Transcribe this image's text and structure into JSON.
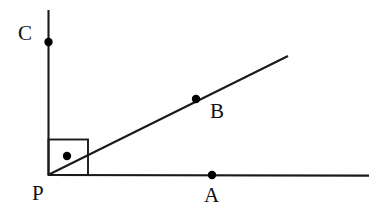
{
  "figure": {
    "kind": "geometry-diagram",
    "background_color": "#ffffff",
    "stroke_color": "#1a1a1a",
    "point_color": "#000000",
    "canvas": {
      "width": 383,
      "height": 217
    },
    "labels": {
      "point_a": "A",
      "point_b": "B",
      "point_c": "C",
      "point_p": "P"
    },
    "label_positions": {
      "point_a": {
        "x": 204,
        "y": 185
      },
      "point_b": {
        "x": 210,
        "y": 101
      },
      "point_c": {
        "x": 18,
        "y": 23
      },
      "point_p": {
        "x": 32,
        "y": 183
      }
    },
    "points": [
      {
        "name": "P",
        "x": 48,
        "y": 175,
        "marked": false,
        "radius": 0
      },
      {
        "name": "C",
        "x": 48,
        "y": 42,
        "marked": true,
        "radius": 4.2
      },
      {
        "name": "B",
        "x": 196,
        "y": 99,
        "marked": true,
        "radius": 4.2
      },
      {
        "name": "A",
        "x": 212,
        "y": 175,
        "marked": true,
        "radius": 4.2
      },
      {
        "name": "angle-dot",
        "x": 67,
        "y": 156,
        "marked": true,
        "radius": 4.2
      }
    ],
    "rays": [
      {
        "name": "ray-PC-vertical",
        "x1": 48,
        "y1": 175,
        "x2": 48,
        "y2": 10,
        "width": 2.1
      },
      {
        "name": "ray-PA-horizontal",
        "x1": 48,
        "y1": 175,
        "x2": 369,
        "y2": 175,
        "width": 2.1
      },
      {
        "name": "ray-PB-diagonal",
        "x1": 48,
        "y1": 175,
        "x2": 288,
        "y2": 56,
        "width": 2.1
      }
    ],
    "right_angle_marker": {
      "name": "right-angle-square",
      "x": 48,
      "y": 139,
      "width": 40,
      "height": 36,
      "stroke_width": 1.9
    }
  }
}
